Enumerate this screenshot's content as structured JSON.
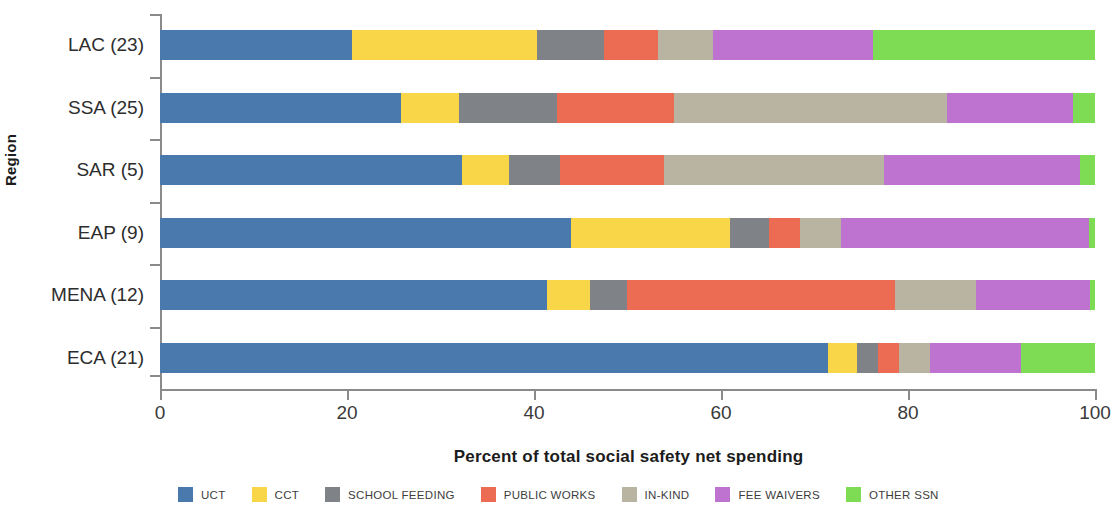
{
  "chart_data": {
    "type": "bar",
    "orientation": "horizontal",
    "stacked": true,
    "normalized": true,
    "title": "",
    "xlabel": "Percent of total social safety net spending",
    "ylabel": "Region",
    "xlim": [
      0,
      100
    ],
    "xticks": [
      0,
      20,
      40,
      60,
      80,
      100
    ],
    "xticklabels": [
      "0",
      "20",
      "40",
      "60",
      "80",
      "100"
    ],
    "grid": false,
    "legend_position": "bottom",
    "categories": [
      "LAC (23)",
      "SSA (25)",
      "SAR (5)",
      "EAP (9)",
      "MENA (12)",
      "ECA (21)"
    ],
    "series": [
      {
        "name": "UCT",
        "color": "#4a79ad",
        "values": [
          20.5,
          25.8,
          32.3,
          44.0,
          41.4,
          71.4
        ]
      },
      {
        "name": "CCT",
        "color": "#f6d council",
        "values": [
          0,
          0,
          0,
          0,
          0,
          0
        ]
      },
      {
        "name": "SCHOOL FEEDING",
        "color": "#7f8286",
        "values": [
          7.2,
          10.5,
          5.5,
          4.1,
          4.0,
          2.3
        ]
      },
      {
        "name": "PUBLIC WORKS",
        "color": "#ec6b53",
        "values": [
          5.8,
          12.5,
          11.1,
          3.4,
          28.6,
          2.2
        ]
      },
      {
        "name": "IN-KIND",
        "color": "#b9b4a1",
        "values": [
          5.8,
          29.2,
          23.5,
          4.3,
          8.7,
          3.4
        ]
      },
      {
        "name": "FEE WAIVERS",
        "color": "#b濃",
        "values": [
          0,
          0,
          0,
          0,
          0,
          0
        ]
      },
      {
        "name": "OTHER SSN",
        "color": "#7ddb54",
        "values": [
          23.7,
          2.4,
          1.6,
          0.6,
          0.5,
          7.9
        ]
      }
    ],
    "series_final": [
      {
        "name": "UCT",
        "color": "#4a79ad",
        "values": [
          20.5,
          25.8,
          32.3,
          44.0,
          41.4,
          71.4
        ]
      },
      {
        "name": "CCT",
        "color": "#f8d648",
        "values": [
          19.8,
          6.2,
          5.0,
          17.0,
          4.6,
          3.1
        ]
      },
      {
        "name": "SCHOOL FEEDING",
        "color": "#7f8286",
        "values": [
          7.2,
          10.5,
          5.5,
          4.1,
          4.0,
          2.3
        ]
      },
      {
        "name": "PUBLIC WORKS",
        "color": "#ec6b53",
        "values": [
          5.8,
          12.5,
          11.1,
          3.4,
          28.6,
          2.2
        ]
      },
      {
        "name": "IN-KIND",
        "color": "#b9b4a1",
        "values": [
          5.8,
          29.2,
          23.5,
          4.3,
          8.7,
          3.4
        ]
      },
      {
        "name": "FEE WAIVERS",
        "color": "#b濃",
        "values": [
          0,
          0,
          0,
          0,
          0,
          0
        ]
      },
      {
        "name": "OTHER SSN",
        "color": "#7ddb54",
        "values": [
          23.7,
          2.4,
          1.6,
          0.6,
          0.5,
          7.9
        ]
      }
    ],
    "stacks": [
      {
        "category": "LAC (23)",
        "values": [
          20.5,
          19.8,
          7.2,
          5.8,
          5.8,
          17.2,
          23.7
        ]
      },
      {
        "category": "SSA (25)",
        "values": [
          25.8,
          6.2,
          10.5,
          12.5,
          29.2,
          13.4,
          2.4
        ]
      },
      {
        "category": "SAR (5)",
        "values": [
          32.3,
          5.0,
          5.5,
          11.1,
          23.5,
          21.0,
          1.6
        ]
      },
      {
        "category": "EAP (9)",
        "values": [
          44.0,
          17.0,
          4.1,
          3.4,
          4.3,
          26.6,
          0.6
        ]
      },
      {
        "category": "MENA (12)",
        "values": [
          41.4,
          4.6,
          4.0,
          28.6,
          8.7,
          12.2,
          0.5
        ]
      },
      {
        "category": "ECA (21)",
        "values": [
          71.4,
          3.1,
          2.3,
          2.2,
          3.4,
          9.7,
          7.9
        ]
      }
    ],
    "legend": [
      {
        "label": "UCT",
        "color": "#4a79ad"
      },
      {
        "label": "CCT",
        "color": "#f8d648"
      },
      {
        "label": "SCHOOL FEEDING",
        "color": "#7f8286"
      },
      {
        "label": "PUBLIC WORKS",
        "color": "#ec6b53"
      },
      {
        "label": "IN-KIND",
        "color": "#b9b4a1"
      },
      {
        "label": "FEE WAIVERS",
        "color": "#bd73cf"
      },
      {
        "label": "OTHER SSN",
        "color": "#7ddb54"
      }
    ]
  }
}
